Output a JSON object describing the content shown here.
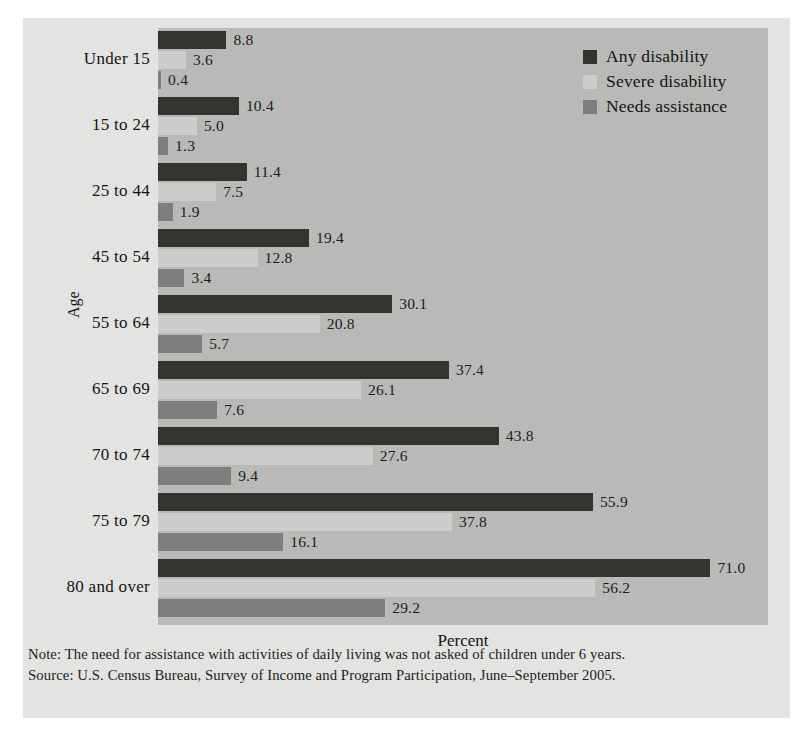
{
  "chart_data": {
    "type": "bar",
    "orientation": "horizontal",
    "title": "",
    "xlabel": "Percent",
    "ylabel": "Age",
    "xlim": [
      0,
      78.4
    ],
    "grid": false,
    "legend_position": "top-right",
    "categories": [
      "Under 15",
      "15 to 24",
      "25 to 44",
      "45 to 54",
      "55 to 64",
      "65 to 69",
      "70 to 74",
      "75 to 79",
      "80 and over"
    ],
    "series": [
      {
        "name": "Any disability",
        "color": "#333330",
        "values": [
          8.8,
          10.4,
          11.4,
          19.4,
          30.1,
          37.4,
          43.8,
          55.9,
          71.0
        ],
        "labels": [
          "8.8",
          "10.4",
          "11.4",
          "19.4",
          "30.1",
          "37.4",
          "43.8",
          "55.9",
          "71.0"
        ]
      },
      {
        "name": "Severe disability",
        "color": "#cdcdcb",
        "values": [
          3.6,
          5.0,
          7.5,
          12.8,
          20.8,
          26.1,
          27.6,
          37.8,
          56.2
        ],
        "labels": [
          "3.6",
          "5.0",
          "7.5",
          "12.8",
          "20.8",
          "26.1",
          "27.6",
          "37.8",
          "56.2"
        ]
      },
      {
        "name": "Needs assistance",
        "color": "#7e7e7c",
        "values": [
          0.4,
          1.3,
          1.9,
          3.4,
          5.7,
          7.6,
          9.4,
          16.1,
          29.2
        ],
        "labels": [
          "0.4",
          "1.3",
          "1.9",
          "3.4",
          "5.7",
          "7.6",
          "9.4",
          "16.1",
          "29.2"
        ]
      }
    ]
  },
  "notes": [
    "Note: The need for assistance with activities of daily living was not asked of children under 6 years.",
    "Source: U.S. Census Bureau, Survey of Income and Program Participation, June–September 2005."
  ]
}
